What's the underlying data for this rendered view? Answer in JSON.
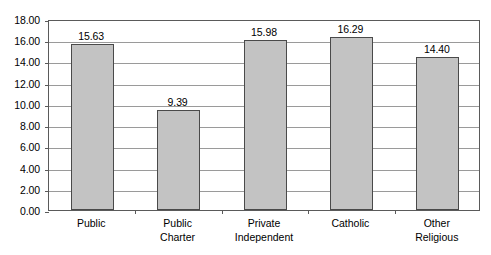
{
  "title_remnant": "",
  "chart_data": {
    "type": "bar",
    "title": "",
    "xlabel": "",
    "ylabel": "",
    "categories": [
      "Public",
      "Public Charter",
      "Private Independent",
      "Catholic",
      "Other Religious"
    ],
    "category_lines": [
      [
        "Public",
        ""
      ],
      [
        "Public",
        "Charter"
      ],
      [
        "Private",
        "Independent"
      ],
      [
        "Catholic",
        ""
      ],
      [
        "Other",
        "Religious"
      ]
    ],
    "values": [
      15.63,
      9.39,
      15.98,
      16.29,
      14.4
    ],
    "value_labels": [
      "15.63",
      "9.39",
      "15.98",
      "16.29",
      "14.40"
    ],
    "ylim": [
      0,
      18
    ],
    "ytick_step": 2,
    "ytick_labels": [
      "0.00",
      "2.00",
      "4.00",
      "6.00",
      "8.00",
      "10.00",
      "12.00",
      "14.00",
      "16.00",
      "18.00"
    ],
    "ytick_values": [
      0,
      2,
      4,
      6,
      8,
      10,
      12,
      14,
      16,
      18
    ],
    "grid": true,
    "legend": false,
    "colors": {
      "bar_fill": "#c3c3c3",
      "bar_border": "#4a4a4a",
      "gridline": "#9a9a9a",
      "frame": "#5a5a5a",
      "text": "#000000",
      "background": "#ffffff"
    }
  }
}
